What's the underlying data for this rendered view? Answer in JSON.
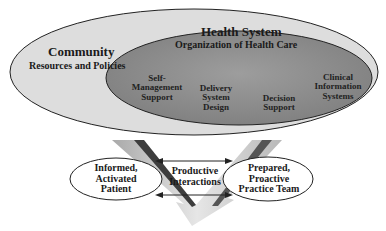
{
  "diagram": {
    "community": {
      "title": "Community",
      "subtitle": "Resources and Policies"
    },
    "health_system": {
      "title": "Health System",
      "subtitle": "Organization of Health Care",
      "components": [
        {
          "line1": "Self-",
          "line2": "Management",
          "line3": "Support"
        },
        {
          "line1": "Delivery",
          "line2": "System",
          "line3": "Design"
        },
        {
          "line1": "Decision",
          "line2": "Support"
        },
        {
          "line1": "Clinical",
          "line2": "Information",
          "line3": "Systems"
        }
      ]
    },
    "patient": {
      "line1": "Informed,",
      "line2": "Activated",
      "line3": "Patient"
    },
    "interactions": {
      "line1": "Productive",
      "line2": "Interactions"
    },
    "team": {
      "line1": "Prepared,",
      "line2": "Proactive",
      "line3": "Practice Team"
    },
    "colors": {
      "outer_fill": "#dcdcdc",
      "inner_fill": "#8f8f8f",
      "arrow_light": "#d8d8d8",
      "arrow_dark": "#444444",
      "stroke": "#222222"
    }
  }
}
